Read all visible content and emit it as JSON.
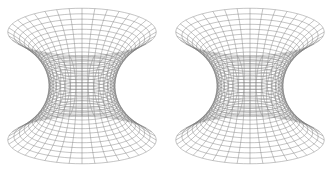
{
  "image": {
    "description": "Stereo pair of wireframe catenoid (minimal surface) renderings",
    "background": "#ffffff",
    "line_color": "#7a7a7a"
  },
  "figures": [
    {
      "name": "left-catenoid",
      "center_x": 82,
      "center_y": 86
    },
    {
      "name": "right-catenoid",
      "center_x": 250,
      "center_y": 86
    }
  ],
  "surface": {
    "type": "catenoid",
    "waist_radius": 33,
    "height_half": 74,
    "t_max": 1.45,
    "tilt_ratio": 0.32,
    "meridians": 36,
    "parallels": 30
  }
}
